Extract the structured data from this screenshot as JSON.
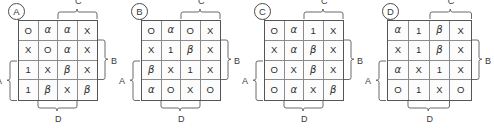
{
  "figure": {
    "line_color": "#555555",
    "grid_line_color": "#8b8b8b",
    "text_color": "#2e2e2e"
  },
  "brackets": {
    "left_label": "A",
    "right_label": "B",
    "top_label": "C",
    "bottom_label": "D"
  },
  "panels": [
    {
      "badge": "A",
      "rows": [
        [
          "O",
          "α",
          "α",
          "X"
        ],
        [
          "X",
          "O",
          "α",
          "X"
        ],
        [
          "1",
          "X",
          "β",
          "X"
        ],
        [
          "1",
          "β",
          "X",
          "β"
        ]
      ],
      "left_bracket": "A",
      "right_bracket": "B",
      "top_bracket": "C",
      "bottom_bracket": "D"
    },
    {
      "badge": "B",
      "rows": [
        [
          "O",
          "α",
          "O",
          "X"
        ],
        [
          "X",
          "1",
          "β",
          "X"
        ],
        [
          "β",
          "X",
          "1",
          "X"
        ],
        [
          "α",
          "O",
          "X",
          "O"
        ]
      ],
      "left_bracket": "A",
      "right_bracket": "B",
      "top_bracket": "C",
      "bottom_bracket": "D"
    },
    {
      "badge": "C",
      "rows": [
        [
          "O",
          "α",
          "1",
          "X"
        ],
        [
          "X",
          "α",
          "β",
          "X"
        ],
        [
          "O",
          "X",
          "β",
          "X"
        ],
        [
          "O",
          "α",
          "X",
          "β"
        ]
      ],
      "left_bracket": "A",
      "right_bracket": "B",
      "top_bracket": "C",
      "bottom_bracket": "D"
    },
    {
      "badge": "D",
      "rows": [
        [
          "α",
          "1",
          "β",
          "X"
        ],
        [
          "X",
          "1",
          "β",
          "X"
        ],
        [
          "α",
          "X",
          "1",
          "X"
        ],
        [
          "O",
          "1",
          "X",
          "O"
        ]
      ],
      "left_bracket": "A",
      "right_bracket": "B",
      "top_bracket": "C",
      "bottom_bracket": "D"
    }
  ]
}
